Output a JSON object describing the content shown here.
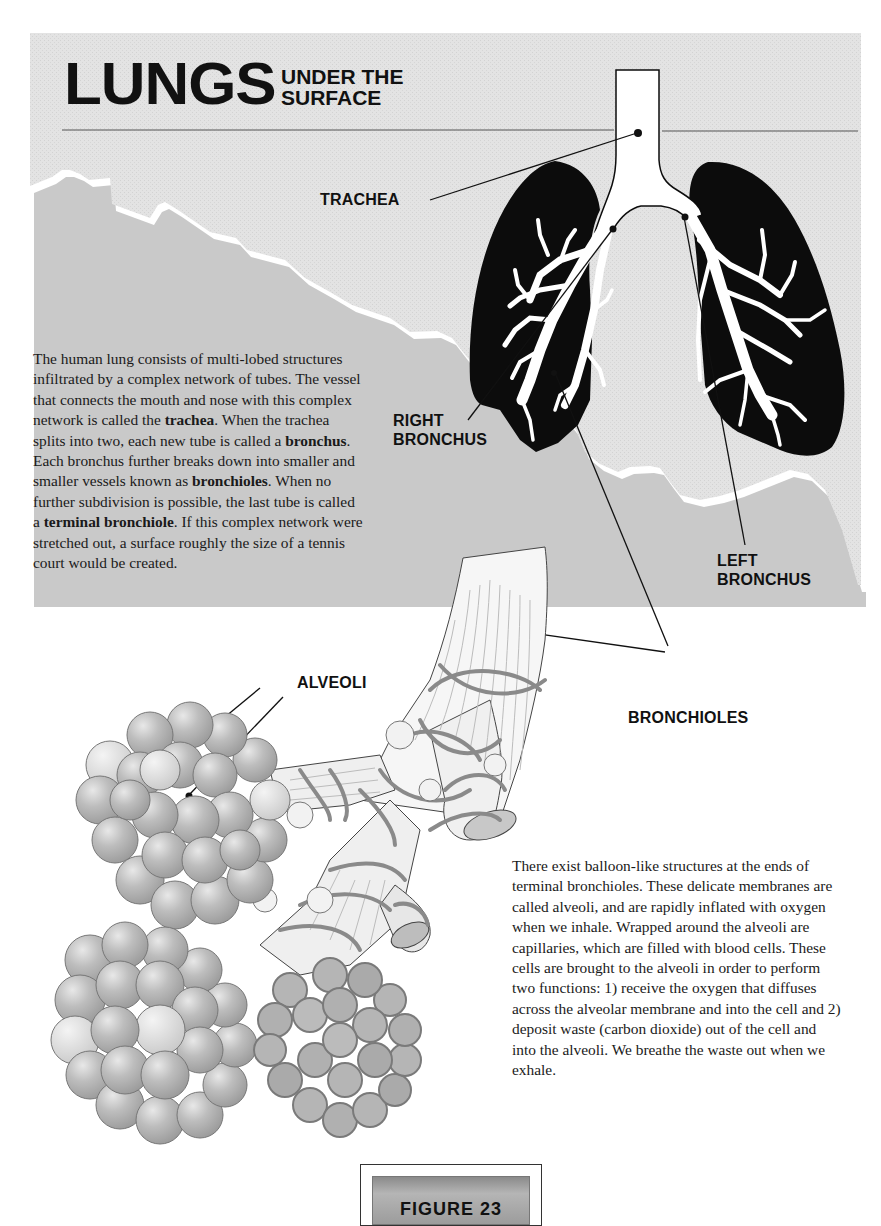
{
  "header": {
    "title_main": "LUNGS",
    "title_sub_line1": "UNDER THE",
    "title_sub_line2": "SURFACE"
  },
  "labels": {
    "trachea": "TRACHEA",
    "right_bronchus_line1": "RIGHT",
    "right_bronchus_line2": "BRONCHUS",
    "left_bronchus_line1": "LEFT",
    "left_bronchus_line2": "BRONCHUS",
    "alveoli": "ALVEOLI",
    "bronchioles": "BRONCHIOLES"
  },
  "paragraph1": {
    "p1": "The human lung consists of multi-lobed structures infiltrated by a complex network of tubes.  The vessel that connects the mouth and nose with this complex network is called the ",
    "b1": "trachea",
    "p2": ".  When the trachea splits into two, each new tube is called a ",
    "b2": "bronchus",
    "p3": ". Each bronchus further breaks down into smaller and smaller vessels known as ",
    "b3": "bronchioles",
    "p4": ".  When no further subdivision is possible, the last tube is called a ",
    "b4": "terminal bronchiole",
    "p5": ".  If this complex network were stretched out, a surface roughly the size of a tennis court would be created."
  },
  "paragraph2": {
    "text": "There exist balloon-like structures at the ends of terminal bronchioles.  These delicate membranes are called alveoli, and are rapidly inflated with oxygen when we inhale. Wrapped around the alveoli are capillaries, which are filled with blood cells. These cells are brought to the alveoli in order to perform two functions: 1) receive the oxygen that diffuses across the alveolar membrane and into the cell and 2)  deposit waste (carbon dioxide) out of the cell and into the alveoli.  We breathe the waste out when we exhale."
  },
  "figure_box": {
    "label": "FIGURE 23"
  },
  "colors": {
    "panel_gray": "#e4e4e4",
    "lung_black": "#0d0d0d",
    "alveoli_gray": "#b9b9b9",
    "capillary_gray": "#8f8f8f",
    "text": "#111111"
  }
}
